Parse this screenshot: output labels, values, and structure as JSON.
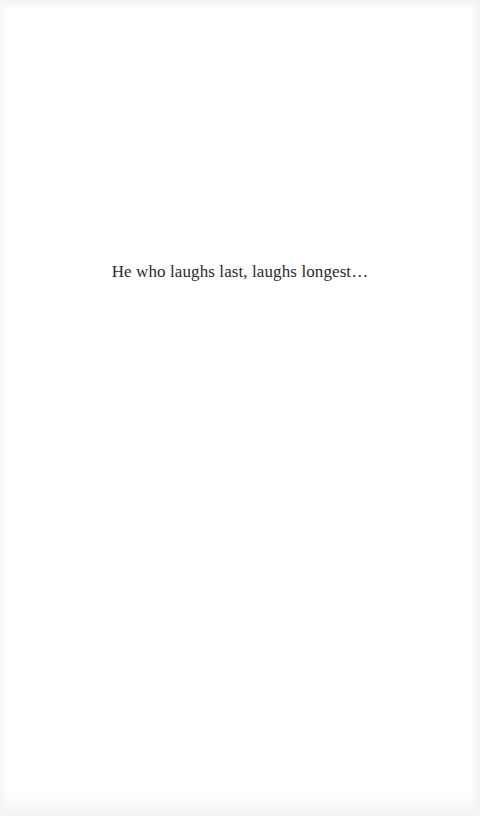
{
  "page": {
    "background": "#ffffff",
    "text_color": "#2a2a2a"
  },
  "epigraph": {
    "text": "He who laughs last, laughs longest…"
  }
}
